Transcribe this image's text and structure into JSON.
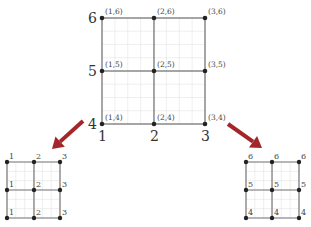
{
  "main_grid": {
    "x_values": [
      1,
      2,
      3
    ],
    "y_values": [
      4,
      5,
      6
    ],
    "x_axis_labels": [
      "1",
      "2",
      "3"
    ],
    "y_axis_labels": [
      "4",
      "5",
      "6"
    ],
    "nodes": [
      {
        "label": "(1,6)"
      },
      {
        "label": "(2,6)"
      },
      {
        "label": "(3,6)"
      },
      {
        "label": "(1,5)"
      },
      {
        "label": "(2,5)"
      },
      {
        "label": "(3,5)"
      },
      {
        "label": "(1,4)"
      },
      {
        "label": "(2,4)"
      },
      {
        "label": "(3,4)"
      }
    ]
  },
  "left_grid": {
    "description": "x-coordinate projection",
    "rows": [
      [
        "1",
        "2",
        "3"
      ],
      [
        "1",
        "2",
        "3"
      ],
      [
        "1",
        "2",
        "3"
      ]
    ]
  },
  "right_grid": {
    "description": "y-coordinate projection",
    "rows": [
      [
        "6",
        "6",
        "6"
      ],
      [
        "5",
        "5",
        "5"
      ],
      [
        "4",
        "4",
        "4"
      ]
    ]
  },
  "colors": {
    "arrow": "#a3262a",
    "node": "#222222",
    "edge": "#555555"
  }
}
